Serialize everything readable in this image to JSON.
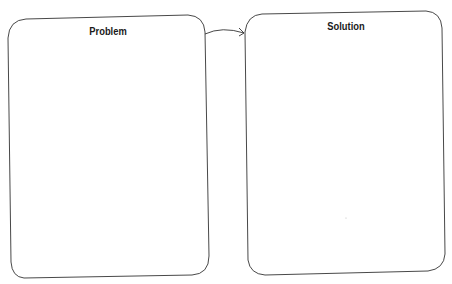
{
  "diagram": {
    "boxes": [
      {
        "id": "problem",
        "title": "Problem"
      },
      {
        "id": "solution",
        "title": "Solution"
      }
    ],
    "arrow": {
      "from": "problem",
      "to": "solution"
    },
    "colors": {
      "stroke": "#333333",
      "background": "#ffffff",
      "text": "#1a1a1a"
    }
  }
}
